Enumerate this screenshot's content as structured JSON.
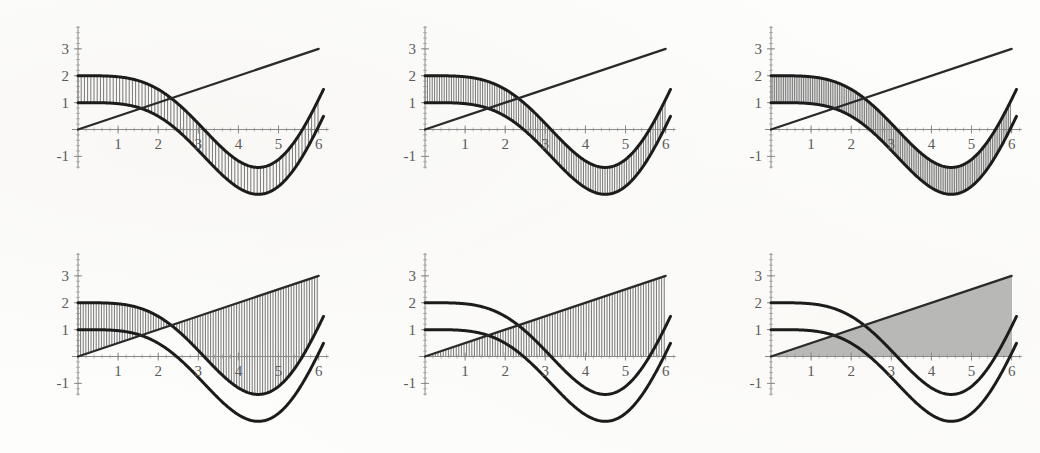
{
  "figure": {
    "title": "",
    "panel_count": 6,
    "rows": 2,
    "cols": 3,
    "background_color": "#fdfdfc",
    "curve_color": "#1c1c1c",
    "line_color": "#2a2a2a",
    "hatch_color": "#4a4a4a",
    "axis_color": "#8a8a88",
    "label_color": "#5a5a58"
  },
  "chart_data": {
    "type": "line",
    "title": "",
    "subtitle": "",
    "xlabel": "",
    "ylabel": "",
    "xlim": [
      -0.15,
      6.25
    ],
    "ylim": [
      -1.45,
      3.85
    ],
    "grid": false,
    "legend": "none",
    "xticks": [
      1,
      2,
      3,
      4,
      5,
      6
    ],
    "xtick_labels": [
      "1",
      "2",
      "3",
      "4",
      "5",
      "6"
    ],
    "yticks": [
      -1,
      1,
      2,
      3
    ],
    "ytick_labels": [
      "-1",
      "1",
      "2",
      "3"
    ],
    "minor_tick_step": 0.2,
    "series": [
      {
        "name": "upper_curve",
        "expr": "1 + cos(x) + 0.5*x*sin(x)",
        "style": "thick-black",
        "x": [
          0,
          0.25,
          0.5,
          0.75,
          1,
          1.25,
          1.5,
          1.75,
          2,
          2.25,
          2.5,
          2.75,
          3,
          3.25,
          3.5,
          3.75,
          4,
          4.25,
          4.5,
          4.75,
          5,
          5.25,
          5.5,
          5.75,
          6
        ],
        "values": [
          2.0,
          1.98,
          1.99,
          1.99,
          1.96,
          1.9,
          1.82,
          1.75,
          1.73,
          1.81,
          2.02,
          2.34,
          2.6,
          2.66,
          2.48,
          2.12,
          1.73,
          1.47,
          1.41,
          1.53,
          1.81,
          2.25,
          2.81,
          3.4,
          3.96
        ]
      },
      {
        "name": "lower_curve",
        "expr": "cos(x) + 0.5*x*sin(x) (shifted)",
        "style": "thick-black",
        "x": [
          0,
          0.25,
          0.5,
          0.75,
          1,
          1.25,
          1.5,
          1.75,
          2,
          2.25,
          2.5,
          2.75,
          3,
          3.25,
          3.5,
          3.75,
          4,
          4.25,
          4.5,
          4.75,
          5,
          5.25,
          5.5,
          5.75,
          6
        ],
        "values": [
          1.0,
          0.72,
          0.24,
          -0.3,
          -0.73,
          -0.95,
          -0.96,
          -0.79,
          -0.48,
          -0.11,
          0.27,
          0.6,
          0.82,
          0.9,
          0.83,
          0.62,
          0.32,
          -0.04,
          -0.4,
          -0.7,
          -0.9,
          -0.95,
          -0.81,
          -0.48,
          0.0
        ]
      },
      {
        "name": "straight_line",
        "expr": "0.5*x",
        "style": "thick-straight",
        "x": [
          0,
          6
        ],
        "values": [
          0.0,
          3.0
        ]
      }
    ]
  },
  "panels": [
    {
      "id": "panel-1",
      "index": 1,
      "position": "top-left",
      "hatch_region": "between lower_curve and upper_curve",
      "hatch_lower": "lower_curve",
      "hatch_upper": "upper_curve",
      "hatch_x_start": 0.0,
      "hatch_x_end": 6.0,
      "hatch_spacing_px": 3.2
    },
    {
      "id": "panel-2",
      "index": 2,
      "position": "top-center",
      "hatch_region": "between lower_curve and upper_curve, denser",
      "hatch_lower": "lower_curve",
      "hatch_upper": "upper_curve",
      "hatch_x_start": 0.0,
      "hatch_x_end": 6.0,
      "hatch_spacing_px": 2.4
    },
    {
      "id": "panel-3",
      "index": 3,
      "position": "top-right",
      "hatch_region": "between lower_curve and upper_curve, densest",
      "hatch_lower": "lower_curve",
      "hatch_upper": "upper_curve",
      "hatch_x_start": 0.0,
      "hatch_x_end": 6.0,
      "hatch_spacing_px": 1.8
    },
    {
      "id": "panel-4",
      "index": 4,
      "position": "bottom-left",
      "hatch_region": "between straight_line and upper_curve",
      "hatch_lower": "straight_line",
      "hatch_upper": "upper_curve",
      "hatch_x_start": 0.0,
      "hatch_x_end": 6.0,
      "hatch_spacing_px": 2.6
    },
    {
      "id": "panel-5",
      "index": 5,
      "position": "bottom-center",
      "hatch_region": "between zero axis and straight_line",
      "hatch_lower": "zero",
      "hatch_upper": "straight_line",
      "hatch_x_start": 0.0,
      "hatch_x_end": 6.0,
      "hatch_spacing_px": 2.6
    },
    {
      "id": "panel-6",
      "index": 6,
      "position": "bottom-right",
      "hatch_region": "between zero axis and straight_line, solid fill",
      "hatch_lower": "zero",
      "hatch_upper": "straight_line",
      "hatch_x_start": 0.0,
      "hatch_x_end": 6.0,
      "hatch_spacing_px": 2.0
    }
  ]
}
